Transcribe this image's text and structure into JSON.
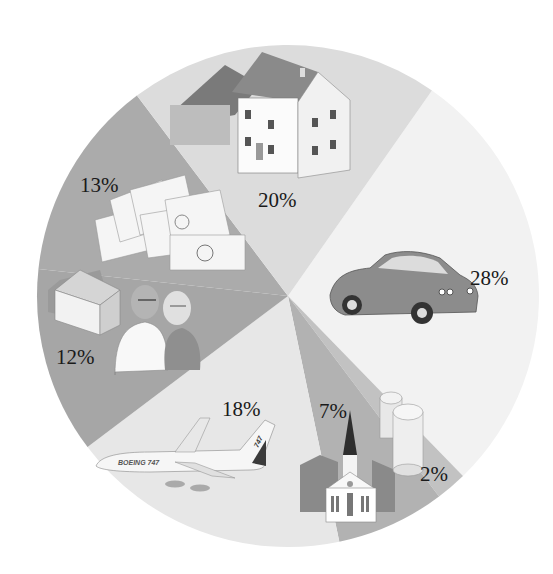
{
  "chart_data": {
    "type": "pie",
    "title": "",
    "start_angle_deg_clockwise_from_top": 35,
    "direction": "clockwise",
    "legend": "none",
    "slices": [
      {
        "label": "Car",
        "value": 28,
        "display": "28%",
        "color": "#f2f2f2",
        "icon": "car-icon"
      },
      {
        "label": "Coins",
        "value": 2,
        "display": "2%",
        "color": "#c2c2c2",
        "icon": "coins-icon"
      },
      {
        "label": "Church",
        "value": 7,
        "display": "7%",
        "color": "#b2b2b2",
        "icon": "church-icon"
      },
      {
        "label": "Travel",
        "value": 18,
        "display": "18%",
        "color": "#e7e7e7",
        "icon": "airplane-icon"
      },
      {
        "label": "Retirement",
        "value": 12,
        "display": "12%",
        "color": "#a6a6a6",
        "icon": "retired-couple-icon"
      },
      {
        "label": "Money",
        "value": 13,
        "display": "13%",
        "color": "#ababab",
        "icon": "money-icon"
      },
      {
        "label": "House",
        "value": 20,
        "display": "20%",
        "color": "#dcdcdc",
        "icon": "house-icon"
      }
    ]
  },
  "labels": {
    "car": "28%",
    "coins": "2%",
    "church": "7%",
    "travel": "18%",
    "retirement": "12%",
    "money": "13%",
    "house": "20%",
    "airplane_text": "BOEING 747",
    "airplane_tail": "747"
  }
}
